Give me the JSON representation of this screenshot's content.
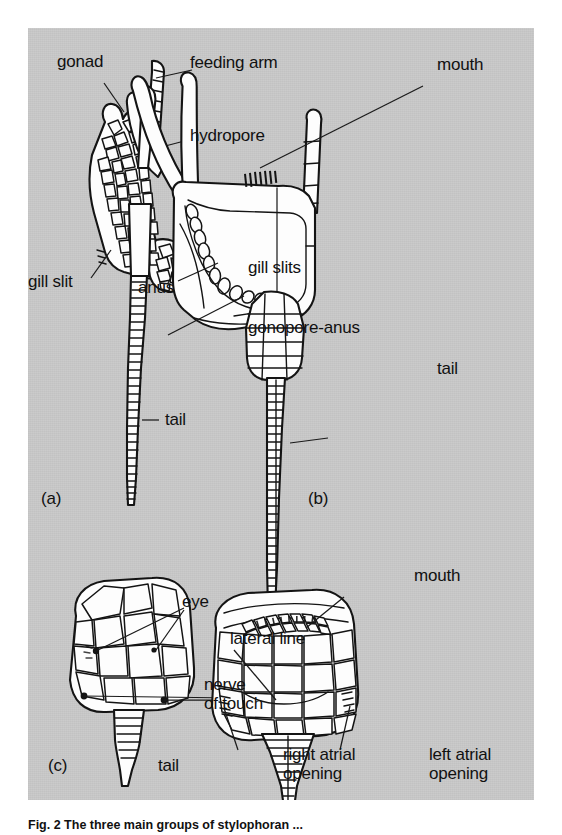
{
  "figure": {
    "background_color": "#c9c9c9",
    "page_color": "#ffffff",
    "ink_color": "#111111",
    "caption": "Fig. 2  The three main groups of stylophoran ..."
  },
  "panels": [
    {
      "id": "a",
      "id_label": "(a)",
      "subject": "cornute stylophoran, dorsal view",
      "labels": [
        {
          "key": "gonad",
          "text": "gonad"
        },
        {
          "key": "feeding_arm",
          "text": "feeding arm"
        },
        {
          "key": "hydropore",
          "text": "hydropore"
        },
        {
          "key": "gill_slit",
          "text": "gill slit"
        },
        {
          "key": "anus",
          "text": "anus"
        },
        {
          "key": "tail",
          "text": "tail"
        }
      ]
    },
    {
      "id": "b",
      "id_label": "(b)",
      "subject": "mitrate stylophoran, lateral view",
      "labels": [
        {
          "key": "mouth",
          "text": "mouth"
        },
        {
          "key": "gill_slits",
          "text": "gill slits"
        },
        {
          "key": "gonopore_anus",
          "text": "gonopore-anus"
        },
        {
          "key": "tail",
          "text": "tail"
        }
      ]
    },
    {
      "id": "c",
      "id_label": "(c)",
      "subject": "mitrate head, dorsal view",
      "labels": [
        {
          "key": "eye",
          "text": "eye"
        },
        {
          "key": "nerve_of_touch",
          "text": "nerve\nof touch"
        },
        {
          "key": "tail",
          "text": "tail"
        }
      ]
    },
    {
      "id": "d",
      "id_label": "",
      "subject": "mitrate head, ventral view",
      "labels": [
        {
          "key": "mouth",
          "text": "mouth"
        },
        {
          "key": "lateral_line",
          "text": "lateral line"
        },
        {
          "key": "right_atrial_opening",
          "text": "right atrial\nopening"
        },
        {
          "key": "left_atrial_opening",
          "text": "left atrial\nopening"
        }
      ]
    }
  ]
}
